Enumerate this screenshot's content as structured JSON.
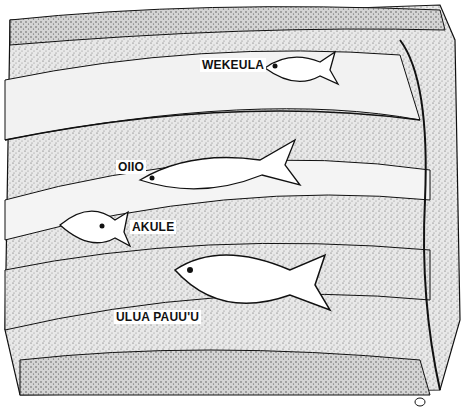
{
  "illustration": {
    "description": "Underwater cross-section illustration of a reef ledge with four fish species",
    "labels": [
      {
        "id": "wekeula",
        "text": "WEKEULA",
        "x": 200,
        "y": 58
      },
      {
        "id": "oiio",
        "text": "OIIO",
        "x": 116,
        "y": 160
      },
      {
        "id": "akule",
        "text": "AKULE",
        "x": 130,
        "y": 220
      },
      {
        "id": "ulua-pauuu",
        "text": "ULUA PAUU'U",
        "x": 114,
        "y": 310
      }
    ],
    "colors": {
      "ink": "#111111",
      "paper": "#ffffff",
      "stipple": "#9a9a9a"
    }
  }
}
